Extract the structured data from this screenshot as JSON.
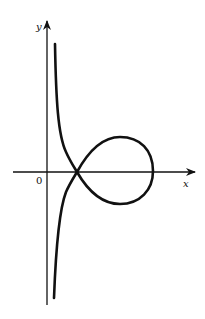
{
  "figure": {
    "colors": {
      "background": "#ffffff",
      "ink": "#111111"
    }
  },
  "axes": {
    "x_label": "x",
    "y_label": "y",
    "origin_label": "0"
  },
  "curve": {
    "type": "strophoid",
    "description": "Curve with a node on the positive x-axis, a closed loop to the right, and two branches asymptotic to a vertical line near the y-axis",
    "node_point": "on positive x-axis",
    "loop_side": "right",
    "asymptote": "vertical, just right of y-axis"
  }
}
